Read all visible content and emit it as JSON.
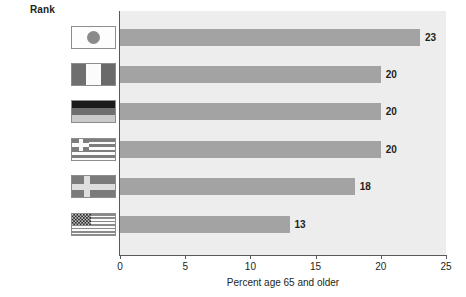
{
  "header": {
    "rank_label": "Rank"
  },
  "chart_data": {
    "type": "bar",
    "orientation": "horizontal",
    "title": "",
    "xlabel": "Percent age 65 and older",
    "ylabel": "",
    "xlim": [
      0,
      25
    ],
    "xticks": [
      0,
      5,
      10,
      15,
      20,
      25
    ],
    "xtick_labels": [
      "0",
      "5",
      "10",
      "15",
      "20",
      "25"
    ],
    "grid": false,
    "legend": "none",
    "categories": [
      "Japan",
      "Italy",
      "Germany",
      "Greece",
      "Sweden",
      "USA"
    ],
    "values": [
      23,
      20,
      20,
      20,
      18,
      13
    ],
    "value_labels": [
      "23",
      "20",
      "20",
      "20",
      "18",
      "13"
    ],
    "ranks": [
      "1.",
      "2.",
      "3.",
      "4.",
      "5.",
      "38."
    ],
    "bar_color": "#a3a3a3",
    "plot_background": "#ededed",
    "axis_color": "#58595b",
    "text_color": "#231f20"
  },
  "rows": [
    {
      "rank": "1.",
      "country": "Japan",
      "value": 23,
      "value_label": "23",
      "flag": "flag-japan"
    },
    {
      "rank": "2.",
      "country": "Italy",
      "value": 20,
      "value_label": "20",
      "flag": "flag-italy"
    },
    {
      "rank": "3.",
      "country": "Germany",
      "value": 20,
      "value_label": "20",
      "flag": "flag-germany"
    },
    {
      "rank": "4.",
      "country": "Greece",
      "value": 20,
      "value_label": "20",
      "flag": "flag-greece"
    },
    {
      "rank": "5.",
      "country": "Sweden",
      "value": 18,
      "value_label": "18",
      "flag": "flag-sweden"
    },
    {
      "rank": "38.",
      "country": "USA",
      "value": 13,
      "value_label": "13",
      "flag": "flag-usa"
    }
  ]
}
